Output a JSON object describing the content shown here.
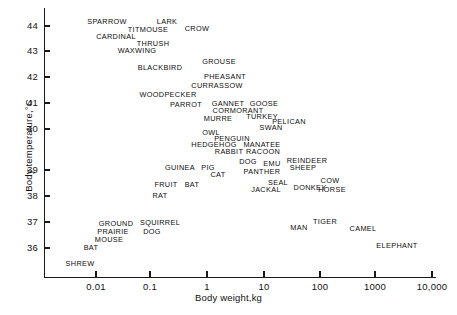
{
  "figure": {
    "background": "#ffffff",
    "ink_color": "#111111"
  },
  "chart_data": {
    "type": "scatter",
    "title": "",
    "xlabel": "Body weight,kg",
    "ylabel": "Body temperature,°C",
    "xscale": "log",
    "yscale": "linear",
    "grid": false,
    "legend": "none",
    "xlim": [
      0.002,
      17000
    ],
    "ylim": [
      35.3,
      44.6
    ],
    "xtick_labels": [
      "0.01",
      "0.1",
      "1",
      "10",
      "100",
      "1000",
      "10,000"
    ],
    "xtick_values": [
      0.01,
      0.1,
      1,
      10,
      100,
      1000,
      10000
    ],
    "ytick_labels": [
      "36",
      "37",
      "38",
      "39",
      "40",
      "41",
      "42",
      "43",
      "44"
    ],
    "ytick_values": [
      36,
      37,
      38,
      39,
      40,
      41,
      42,
      43,
      44
    ],
    "point_label_style": "text-only, no marker glyphs",
    "points": [
      {
        "label": "SPARROW",
        "px": 107,
        "py": 22
      },
      {
        "label": "LARK",
        "px": 167,
        "py": 22
      },
      {
        "label": "TITMOUSE",
        "px": 148,
        "py": 30
      },
      {
        "label": "CROW",
        "px": 197,
        "py": 29
      },
      {
        "label": "CARDINAL",
        "px": 116,
        "py": 37
      },
      {
        "label": "THRUSH",
        "px": 153,
        "py": 44
      },
      {
        "label": "WAXWING",
        "px": 137,
        "py": 51
      },
      {
        "label": "BLACKBIRD",
        "px": 160,
        "py": 68
      },
      {
        "label": "GROUSE",
        "px": 219,
        "py": 62
      },
      {
        "label": "PHEASANT",
        "px": 225,
        "py": 77
      },
      {
        "label": "CURRASSOW",
        "px": 217,
        "py": 86
      },
      {
        "label": "WOODPECKER",
        "px": 168,
        "py": 95
      },
      {
        "label": "PARROT",
        "px": 186,
        "py": 105
      },
      {
        "label": "GANNET",
        "px": 228,
        "py": 104
      },
      {
        "label": "GOOSE",
        "px": 264,
        "py": 104
      },
      {
        "label": "CORMORANT",
        "px": 238,
        "py": 111
      },
      {
        "label": "MURRE",
        "px": 218,
        "py": 119
      },
      {
        "label": "TURKEY",
        "px": 262,
        "py": 117
      },
      {
        "label": "PELICAN",
        "px": 289,
        "py": 122
      },
      {
        "label": "SWAN",
        "px": 271,
        "py": 128
      },
      {
        "label": "OWL",
        "px": 211,
        "py": 133
      },
      {
        "label": "PENGUIN",
        "px": 232,
        "py": 139
      },
      {
        "label": "HEDGEHOG",
        "px": 214,
        "py": 145
      },
      {
        "label": "MANATEE",
        "px": 262,
        "py": 145
      },
      {
        "label": "RABBIT",
        "px": 229,
        "py": 152
      },
      {
        "label": "RACOON",
        "px": 263,
        "py": 152
      },
      {
        "label": "DOG",
        "px": 248,
        "py": 162
      },
      {
        "label": "EMU",
        "px": 272,
        "py": 164
      },
      {
        "label": "REINDEER",
        "px": 307,
        "py": 161
      },
      {
        "label": "SHEEP",
        "px": 303,
        "py": 168
      },
      {
        "label": "GUINEA",
        "px": 180,
        "py": 168
      },
      {
        "label": "PIG",
        "px": 208,
        "py": 168
      },
      {
        "label": "CAT",
        "px": 218,
        "py": 175
      },
      {
        "label": "PANTHER",
        "px": 262,
        "py": 172
      },
      {
        "label": "FRUIT",
        "px": 166,
        "py": 185
      },
      {
        "label": "BAT",
        "px": 192,
        "py": 185
      },
      {
        "label": "SEAL",
        "px": 278,
        "py": 183
      },
      {
        "label": "COW",
        "px": 330,
        "py": 181
      },
      {
        "label": "JACKAL",
        "px": 266,
        "py": 190
      },
      {
        "label": "DONKEY",
        "px": 310,
        "py": 188
      },
      {
        "label": "HORSE",
        "px": 332,
        "py": 190
      },
      {
        "label": "RAT",
        "px": 160,
        "py": 196
      },
      {
        "label": "GROUND",
        "px": 116,
        "py": 224
      },
      {
        "label": "SQUIRREL",
        "px": 160,
        "py": 223
      },
      {
        "label": "PRAIRIE",
        "px": 113,
        "py": 232
      },
      {
        "label": "DOG",
        "px": 152,
        "py": 232
      },
      {
        "label": "MOUSE",
        "px": 109,
        "py": 240
      },
      {
        "label": "TIGER",
        "px": 325,
        "py": 222
      },
      {
        "label": "MAN",
        "px": 299,
        "py": 228
      },
      {
        "label": "CAMEL",
        "px": 363,
        "py": 229
      },
      {
        "label": "BAT",
        "px": 91,
        "py": 248
      },
      {
        "label": "SHREW",
        "px": 80,
        "py": 264
      },
      {
        "label": "ELEPHANT",
        "px": 397,
        "py": 246
      }
    ]
  },
  "axes_geometry": {
    "origin_px": {
      "x": 44,
      "y": 277
    },
    "x_decade_px": 57,
    "y_degree_px": 25.8,
    "x_tick_px": [
      96,
      150,
      207,
      264,
      320,
      375,
      432
    ],
    "y_tick_px": [
      248,
      222,
      196,
      170,
      129,
      103,
      77,
      51,
      26
    ]
  }
}
